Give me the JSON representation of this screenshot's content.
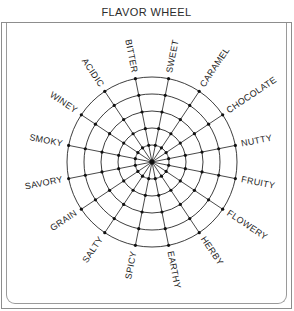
{
  "header": {
    "title": "FLAVOR WHEEL"
  },
  "chart_data": {
    "type": "radar",
    "title": "FLAVOR WHEEL",
    "grid": true,
    "legend_position": "none",
    "ring_count": 5,
    "spoke_count": 16,
    "center": {
      "x": 152,
      "y": 162
    },
    "outer_radius": 85,
    "ring_radii": [
      17,
      34,
      51,
      68,
      85
    ],
    "categories": [
      "SWEET",
      "CARAMEL",
      "CHOCOLATE",
      "NUTTY",
      "FRUITY",
      "FLOWERY",
      "HERBY",
      "EARTHY",
      "SPICY",
      "SALTY",
      "GRAIN",
      "SAVORY",
      "SMOKY",
      "WINEY",
      "ACIDIC",
      "BITTER"
    ],
    "values": [
      5,
      5,
      5,
      5,
      5,
      5,
      5,
      5,
      5,
      5,
      5,
      5,
      5,
      5,
      5,
      5
    ],
    "xlabel": "",
    "ylabel": "",
    "ylim": [
      0,
      5
    ]
  },
  "colors": {
    "stroke": "#1a1a1a",
    "frame": "#8d8d8d",
    "text": "#1d1d1d",
    "background": "#ffffff"
  }
}
